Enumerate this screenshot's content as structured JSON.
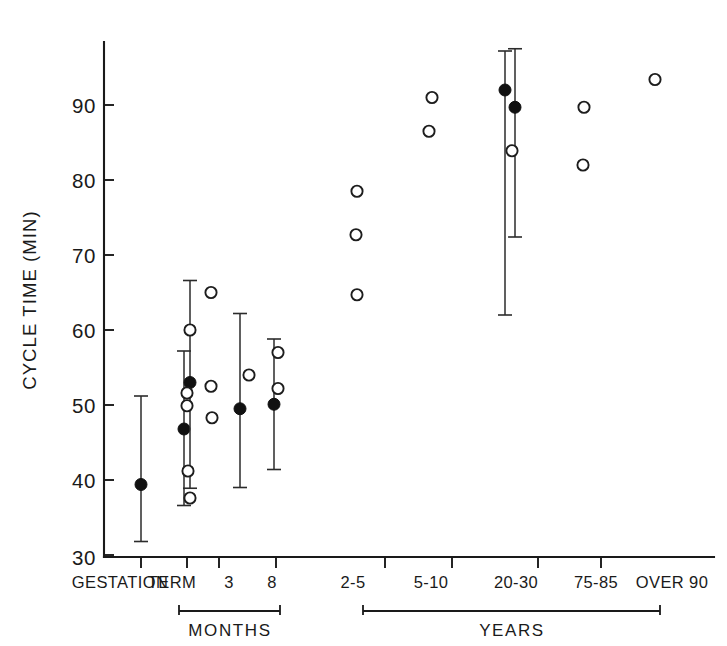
{
  "chart_data": {
    "type": "scatter",
    "title": "",
    "xlabel": "",
    "ylabel": "CYCLE TIME (MIN)",
    "ylim": [
      30,
      97
    ],
    "yticks": [
      30,
      40,
      50,
      60,
      70,
      80,
      90
    ],
    "ytick_labels": [
      "30",
      "40",
      "50",
      "60",
      "70",
      "80",
      "90"
    ],
    "grid": false,
    "legend": "none",
    "categories": [
      "GESTATION",
      "TERM",
      "3",
      "8",
      "2-5",
      "5-10",
      "20-30",
      "75-85",
      "OVER 90"
    ],
    "xtick_labels": [
      "GESTATION",
      "TERM",
      "3",
      "8",
      "2-5",
      "5-10",
      "20-30",
      "75-85",
      "OVER 90"
    ],
    "group_brackets": [
      {
        "label": "MONTHS",
        "from_category": "TERM",
        "to_category": "8"
      },
      {
        "label": "YEARS",
        "from_category": "2-5",
        "to_category": "OVER 90"
      }
    ],
    "series": [
      {
        "name": "mean with range (filled circle)",
        "marker": "filled-circle",
        "points": [
          {
            "category": "GESTATION",
            "x": 141,
            "value": 39.4,
            "err_low": 31.8,
            "err_high": 51.2
          },
          {
            "category": "TERM",
            "x": 184,
            "value": 46.8,
            "err_low": 36.6,
            "err_high": 57.2
          },
          {
            "category": "TERM",
            "x": 190,
            "value": 53.0,
            "err_low": 38.9,
            "err_high": 66.6
          },
          {
            "category": "3",
            "x": 240,
            "value": 49.5,
            "err_low": 39.0,
            "err_high": 62.2
          },
          {
            "category": "8",
            "x": 274,
            "value": 50.1,
            "err_low": 41.4,
            "err_high": 58.8
          },
          {
            "category": "20-30",
            "x": 505,
            "value": 92.0,
            "err_low": 62.0,
            "err_high": 97.2
          },
          {
            "category": "20-30",
            "x": 515,
            "value": 89.7,
            "err_low": 72.4,
            "err_high": 97.5
          }
        ]
      },
      {
        "name": "individual subject (open circle)",
        "marker": "open-circle",
        "points": [
          {
            "category": "TERM",
            "x": 190,
            "value": 60.0
          },
          {
            "category": "TERM",
            "x": 187,
            "value": 51.6
          },
          {
            "category": "TERM",
            "x": 187,
            "value": 49.9
          },
          {
            "category": "TERM",
            "x": 188,
            "value": 41.2
          },
          {
            "category": "TERM",
            "x": 190,
            "value": 37.6
          },
          {
            "category": "TERM",
            "x": 211,
            "value": 65.0
          },
          {
            "category": "TERM",
            "x": 211,
            "value": 52.5
          },
          {
            "category": "TERM",
            "x": 212,
            "value": 48.3
          },
          {
            "category": "3",
            "x": 249,
            "value": 54.0
          },
          {
            "category": "8",
            "x": 278,
            "value": 57.0
          },
          {
            "category": "8",
            "x": 278,
            "value": 52.2
          },
          {
            "category": "2-5",
            "x": 357,
            "value": 78.5
          },
          {
            "category": "2-5",
            "x": 356,
            "value": 72.7
          },
          {
            "category": "2-5",
            "x": 357,
            "value": 64.7
          },
          {
            "category": "5-10",
            "x": 432,
            "value": 91.0
          },
          {
            "category": "5-10",
            "x": 429,
            "value": 86.5
          },
          {
            "category": "20-30",
            "x": 512,
            "value": 83.9
          },
          {
            "category": "75-85",
            "x": 584,
            "value": 89.7
          },
          {
            "category": "75-85",
            "x": 583,
            "value": 82.0
          },
          {
            "category": "OVER 90",
            "x": 655,
            "value": 93.4
          }
        ]
      }
    ]
  },
  "axes": {
    "y_label": "CYCLE TIME (MIN)",
    "y_tick_labels": [
      "90",
      "80",
      "70",
      "60",
      "50",
      "40",
      "30"
    ],
    "x_tick_labels": [
      "GESTATION",
      "TERM",
      "3",
      "8",
      "2-5",
      "5-10",
      "20-30",
      "75-85",
      "OVER 90"
    ],
    "bracket_months": "MONTHS",
    "bracket_years": "YEARS"
  }
}
